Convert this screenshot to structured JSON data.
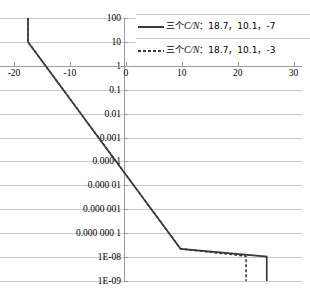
{
  "chart_data": {
    "type": "line",
    "title": "",
    "xlabel": "",
    "ylabel": "",
    "xlim": [
      -22.5,
      31.5
    ],
    "ylim_exponents": [
      -9,
      2
    ],
    "yscale": "log",
    "grid": true,
    "legend_position": "top-right",
    "x_ticks": [
      "-20",
      "-10",
      "0",
      "10",
      "20",
      "30"
    ],
    "x_tick_values": [
      -20,
      -10,
      0,
      10,
      20,
      30
    ],
    "y_ticks": [
      "100",
      "10",
      "1",
      "0.1",
      "0.01",
      "0.001",
      "0.000 1",
      "0.000 01",
      "0.000 001",
      "0.000 000 1",
      "1E-08",
      "1E-09"
    ],
    "y_tick_values": [
      100,
      10,
      1,
      0.1,
      0.01,
      0.001,
      0.0001,
      1e-05,
      1e-06,
      1e-07,
      1e-08,
      1e-09
    ],
    "series": [
      {
        "name": "三个C/N：18.7，10.1，-7",
        "style": "solid",
        "color": "#3a3a3a",
        "points": [
          [
            -17.5,
            100
          ],
          [
            -17.5,
            10
          ],
          [
            9.8,
            2.2e-08
          ],
          [
            25.2,
            1.05e-08
          ],
          [
            25.2,
            1e-09
          ]
        ]
      },
      {
        "name": "三个C/N：18.7，10.1，-3",
        "style": "dashed",
        "color": "#3a3a3a",
        "points": [
          [
            -17.5,
            100
          ],
          [
            -17.5,
            10
          ],
          [
            9.8,
            2.2e-08
          ],
          [
            21.5,
            1.1e-08
          ],
          [
            21.5,
            1e-09
          ]
        ]
      }
    ]
  },
  "legend": {
    "entries": [
      {
        "prefix": "三个",
        "symbol": "C/N",
        "values": "：18.7，10.1，-7",
        "style": "solid"
      },
      {
        "prefix": "三个",
        "symbol": "C/N",
        "values": "：18.7，10.1，-3",
        "style": "dashed"
      }
    ]
  }
}
